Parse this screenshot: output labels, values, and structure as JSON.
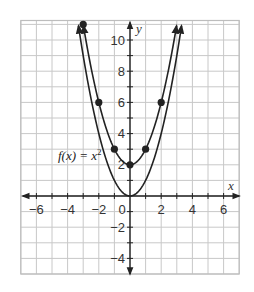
{
  "chart_data": {
    "type": "line",
    "title": "",
    "xlabel": "x",
    "ylabel": "y",
    "xlim": [
      -7,
      7
    ],
    "ylim": [
      -5,
      11.25
    ],
    "grid": true,
    "x_ticks": [
      -6,
      -4,
      -2,
      0,
      2,
      4,
      6
    ],
    "x_tick_labels": [
      "−6",
      "−4",
      "−2",
      "0",
      "2",
      "4",
      "6"
    ],
    "y_ticks": [
      -4,
      -2,
      2,
      4,
      6,
      8,
      10
    ],
    "y_tick_labels": [
      "−4",
      "−2",
      "2",
      "4",
      "6",
      "8",
      "10"
    ],
    "series": [
      {
        "name": "f(x) = x²",
        "expression": "x^2",
        "label": "f(x) = x",
        "label_superscript": "2",
        "points": []
      },
      {
        "name": "g(x) = x² + 2",
        "expression": "x^2 + 2",
        "points": [
          {
            "x": -3,
            "y": 11
          },
          {
            "x": -2,
            "y": 6
          },
          {
            "x": -1,
            "y": 3
          },
          {
            "x": 0,
            "y": 2
          },
          {
            "x": 1,
            "y": 3
          },
          {
            "x": 2,
            "y": 6
          }
        ]
      }
    ]
  },
  "labels": {
    "x_axis": "x",
    "y_axis": "y",
    "function_label": "f(x) = x",
    "function_superscript": "2"
  },
  "colors": {
    "grid": "#c8c8c8",
    "axis": "#222222",
    "curve": "#222222",
    "point": "#222222"
  }
}
